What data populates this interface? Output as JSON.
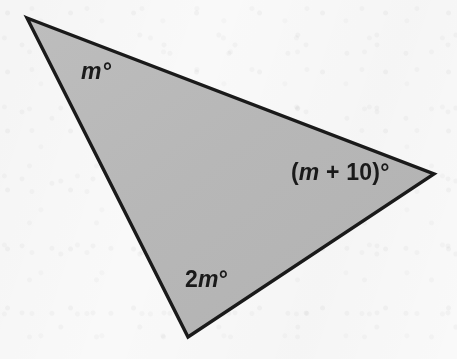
{
  "figure": {
    "kind": "geometry-diagram",
    "shape": "triangle",
    "background_color": "#fbfbfb",
    "fill_color": "#b8b8b8",
    "stroke_color": "#1a1a1a",
    "stroke_width": 3,
    "vertices": [
      {
        "name": "top-left",
        "x": 27,
        "y": 18
      },
      {
        "name": "right",
        "x": 434,
        "y": 174
      },
      {
        "name": "bottom",
        "x": 188,
        "y": 337
      }
    ]
  },
  "chart_data": {
    "type": "diagram",
    "title": "",
    "shape": "triangle",
    "vertices": [
      [
        27,
        18
      ],
      [
        434,
        174
      ],
      [
        188,
        337
      ]
    ],
    "angle_labels": [
      "m°",
      "(m + 10)°",
      "2m°"
    ],
    "fill": "#b8b8b8",
    "stroke": "#1a1a1a"
  },
  "labels": {
    "top_left_angle": {
      "full_text": "m°",
      "variable": "m",
      "suffix": "°"
    },
    "right_angle": {
      "full_text": "(m + 10)°",
      "prefix": "(",
      "variable": "m",
      "operator": " + ",
      "constant": "10",
      "suffix": ")°"
    },
    "bottom_angle": {
      "full_text": "2m°",
      "coefficient": "2",
      "variable": "m",
      "suffix": "°"
    }
  }
}
